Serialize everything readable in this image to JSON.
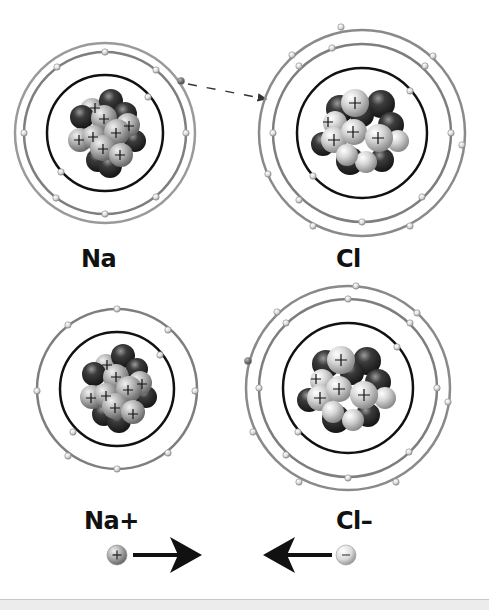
{
  "diagram": {
    "topic": "Ionic bond formation between sodium and chlorine",
    "atoms": [
      {
        "id": "na",
        "label": "Na",
        "center": [
          105,
          133
        ],
        "shell_radii": [
          58,
          81,
          90
        ],
        "electron_counts": [
          2,
          8,
          1
        ],
        "nucleus_plus_count": 9
      },
      {
        "id": "cl",
        "label": "Cl",
        "center": [
          362,
          133
        ],
        "shell_radii": [
          65,
          88,
          103
        ],
        "electron_counts": [
          2,
          8,
          7
        ],
        "nucleus_plus_count": 5
      },
      {
        "id": "na_ion",
        "label": "Na+",
        "center": [
          117,
          389
        ],
        "shell_radii": [
          57,
          80
        ],
        "electron_counts": [
          2,
          8
        ],
        "nucleus_plus_count": 8
      },
      {
        "id": "cl_ion",
        "label": "Cl–",
        "center": [
          348,
          388
        ],
        "shell_radii": [
          65,
          88,
          102
        ],
        "electron_counts": [
          2,
          8,
          8
        ],
        "nucleus_plus_count": 5
      }
    ],
    "transfer_arrow": {
      "from": "Na outer electron",
      "to": "Cl outer shell",
      "style": "dashed"
    },
    "attraction": {
      "positive_symbol": "+",
      "negative_symbol": "–",
      "arrows": [
        "right",
        "left"
      ]
    },
    "colors": {
      "shell_inner": "#111111",
      "shell_outer": "#8a8a8a",
      "proton_light": "#d9d9d9",
      "neutron_dark": "#3a3a3a",
      "transferred_electron": "#7a7a7a",
      "background": "#ffffff",
      "bottom_strip": "#ececec"
    }
  }
}
